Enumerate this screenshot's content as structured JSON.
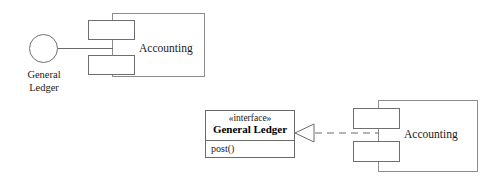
{
  "diagram": {
    "stroke_color": "#6a6a6a",
    "text_color": "#1a1a1a",
    "background": "#ffffff"
  },
  "left_notation": {
    "name": "ball-and-socket (lollipop) notation",
    "provided_interface": {
      "icon": "lollipop-circle-icon",
      "label_line1": "General",
      "label_line2": "Ledger"
    },
    "component": {
      "name": "Accounting",
      "icon": "component-icon",
      "tabs": 2
    },
    "connector": {
      "type": "solid-line",
      "name": "interface-stem"
    }
  },
  "right_notation": {
    "name": "explicit interface and realization notation",
    "interface": {
      "stereotype": "«interface»",
      "title": "General Ledger",
      "operations": [
        "post()"
      ]
    },
    "component": {
      "name": "Accounting",
      "icon": "component-icon",
      "tabs": 2
    },
    "connector": {
      "type": "realization",
      "line_style": "dashed",
      "arrowhead": "hollow-triangle",
      "name": "realization-arrow"
    }
  }
}
